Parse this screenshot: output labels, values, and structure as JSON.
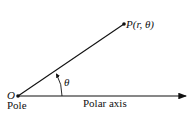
{
  "diagram": {
    "type": "polar-coordinate-system",
    "pole": {
      "symbol": "O",
      "label": "Pole",
      "x": 18,
      "y": 96
    },
    "point": {
      "label": "P(r, θ)",
      "x": 124,
      "y": 24
    },
    "axis": {
      "label": "Polar axis",
      "x_end": 186
    },
    "angle": {
      "label": "θ"
    },
    "colors": {
      "line": "#111111",
      "background": "#ffffff"
    }
  }
}
